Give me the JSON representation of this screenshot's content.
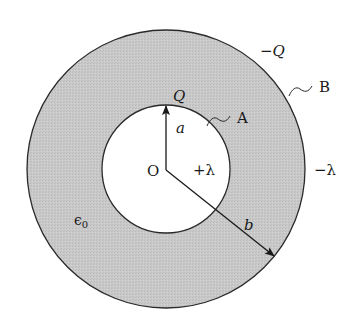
{
  "diagram": {
    "type": "coaxial-cylinder-capacitor-cross-section",
    "colors": {
      "background": "#ffffff",
      "dielectric_fill": "#c8c8c8",
      "stroke": "#2a2a2a",
      "text": "#1a1a1a"
    },
    "geometry": {
      "center": [
        166,
        169
      ],
      "inner_radius": 64,
      "outer_radius": 139
    },
    "labels": {
      "center": "O",
      "inner_charge": "Q",
      "inner_conductor": "A",
      "outer_conductor": "B",
      "outer_charge": "−Q",
      "inner_line_density": "+λ",
      "outer_line_density": "−λ",
      "inner_radius": "a",
      "outer_radius": "b",
      "permittivity": "ϵ0"
    },
    "permittivity_symbol": "ϵ",
    "permittivity_subscript": "0"
  }
}
